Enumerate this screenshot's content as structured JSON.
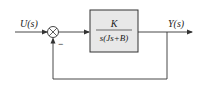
{
  "diagram": {
    "type": "feedback-control-block-diagram",
    "input_label": "U(s)",
    "output_label": "Y(s)",
    "summing_junction": {
      "signs": {
        "feedback": "−"
      }
    },
    "block": {
      "numerator": "K",
      "denominator": "s(Js+B)",
      "fill": "#e8e8e8",
      "stroke": "#333333"
    },
    "feedback": "unity",
    "line_color": "#333333"
  }
}
